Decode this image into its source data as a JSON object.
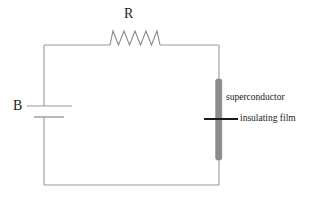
{
  "diagram": {
    "type": "circuit-schematic",
    "background_color": "#ffffff",
    "wire_color": "#9a9a9a",
    "superconductor_color": "#8c8c8c",
    "insulating_film_color": "#1a1a1a",
    "text_color": "#1a1a1a",
    "labels": {
      "resistor": "R",
      "battery": "B",
      "superconductor": "superconductor",
      "insulating_film": "insulating film"
    },
    "components": [
      {
        "name": "battery",
        "label": "B",
        "position": "left-side",
        "symbol": "two-parallel-plates"
      },
      {
        "name": "resistor",
        "label": "R",
        "position": "top-side",
        "symbol": "zigzag",
        "peaks": 6
      },
      {
        "name": "superconductor",
        "label": "superconductor",
        "position": "right-side",
        "symbol": "thick-vertical-gray-bar"
      },
      {
        "name": "insulating-film",
        "label": "insulating film",
        "position": "right-side-middle",
        "symbol": "horizontal-black-line"
      }
    ],
    "circuit_bounds": {
      "left": 44,
      "top": 45,
      "right": 219,
      "bottom": 185
    }
  }
}
